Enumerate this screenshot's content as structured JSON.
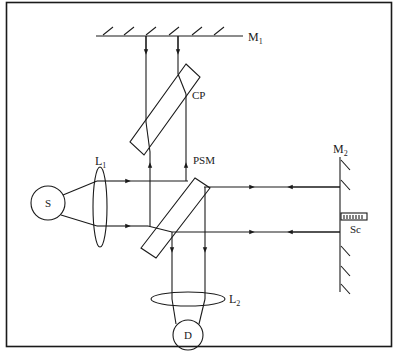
{
  "diagram": {
    "type": "optical-interferometer-schematic",
    "colors": {
      "line": "#1a1a1a",
      "background": "#ffffff"
    },
    "labels": {
      "mirror1": {
        "base": "M",
        "sub": "1"
      },
      "mirror2": {
        "base": "M",
        "sub": "2"
      },
      "compensating_plate": "CP",
      "beam_splitter": "PSM",
      "lens1": {
        "base": "L",
        "sub": "1"
      },
      "lens2": {
        "base": "L",
        "sub": "2"
      },
      "source": "S",
      "detector": "D",
      "scale": "Sc"
    },
    "components": [
      {
        "id": "S",
        "kind": "source",
        "shape": "circle"
      },
      {
        "id": "L1",
        "kind": "lens",
        "shape": "ellipse"
      },
      {
        "id": "PSM",
        "kind": "beam-splitter-plate",
        "shape": "tilted-rectangle"
      },
      {
        "id": "CP",
        "kind": "compensating-plate",
        "shape": "tilted-rectangle"
      },
      {
        "id": "M1",
        "kind": "mirror",
        "orientation": "horizontal"
      },
      {
        "id": "M2",
        "kind": "mirror",
        "orientation": "vertical"
      },
      {
        "id": "Sc",
        "kind": "scale",
        "shape": "graduated-bar"
      },
      {
        "id": "L2",
        "kind": "lens",
        "shape": "ellipse"
      },
      {
        "id": "D",
        "kind": "detector",
        "shape": "circle"
      }
    ],
    "connections": [
      {
        "from": "S",
        "to": "L1"
      },
      {
        "from": "L1",
        "to": "PSM"
      },
      {
        "from": "PSM",
        "to": "CP"
      },
      {
        "from": "CP",
        "to": "M1"
      },
      {
        "from": "PSM",
        "to": "M2"
      },
      {
        "from": "PSM",
        "to": "L2"
      },
      {
        "from": "L2",
        "to": "D"
      }
    ]
  }
}
